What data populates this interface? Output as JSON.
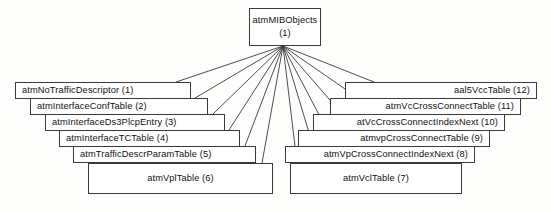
{
  "diagram": {
    "background_color": "#fdfdfc",
    "node_fill": "#ffffff",
    "node_border_color": "#3a3a3a",
    "edge_color": "#3a3a3a",
    "root": {
      "name": "atmMIBObjects",
      "index": "(1)",
      "x": 249,
      "y": 8,
      "width": 72,
      "height": 38
    },
    "fan_origin": {
      "x": 283,
      "y": 46
    },
    "children": [
      {
        "label": "atmNoTrafficDescriptor (1)",
        "name": "atmNoTrafficDescriptor",
        "index": "(1)",
        "align": "left",
        "x": 15,
        "y": 82,
        "width": 176,
        "height": 17,
        "anchor_x": 176,
        "anchor_y": 82
      },
      {
        "label": "atmInterfaceConfTable (2)",
        "name": "atmInterfaceConfTable",
        "index": "(2)",
        "align": "left",
        "x": 30,
        "y": 98,
        "width": 178,
        "height": 17,
        "anchor_x": 195,
        "anchor_y": 98
      },
      {
        "label": "atmInterfaceDs3PlcpEntry (3)",
        "name": "atmInterfaceDs3PlcpEntry",
        "index": "(3)",
        "align": "left",
        "x": 45,
        "y": 114,
        "width": 180,
        "height": 17,
        "anchor_x": 213,
        "anchor_y": 114
      },
      {
        "label": "atmInterfaceTCTable (4)",
        "name": "atmInterfaceTCTable",
        "index": "(4)",
        "align": "left",
        "x": 59,
        "y": 130,
        "width": 181,
        "height": 17,
        "anchor_x": 229,
        "anchor_y": 130
      },
      {
        "label": "atmTrafficDescrParamTable (5)",
        "name": "atmTrafficDescrParamTable",
        "index": "(5)",
        "align": "left",
        "x": 73,
        "y": 146,
        "width": 183,
        "height": 17,
        "anchor_x": 245,
        "anchor_y": 146
      },
      {
        "label": "atmVplTable (6)",
        "name": "atmVplTable",
        "index": "(6)",
        "align": "center",
        "x": 88,
        "y": 163,
        "width": 185,
        "height": 31,
        "anchor_x": 262,
        "anchor_y": 163
      },
      {
        "label": "atmVclTable (7)",
        "name": "atmVclTable",
        "index": "(7)",
        "align": "center",
        "x": 290,
        "y": 163,
        "width": 172,
        "height": 31,
        "anchor_x": 297,
        "anchor_y": 163
      },
      {
        "label": "atmVpCrossConnectIndexNext (8)",
        "name": "atmVpCrossConnectIndexNext",
        "index": "(8)",
        "align": "right",
        "x": 285,
        "y": 146,
        "width": 190,
        "height": 17,
        "anchor_x": 313,
        "anchor_y": 146
      },
      {
        "label": "atmvpCrossConnectTable (9)",
        "name": "atmvpCrossConnectTable",
        "index": "(9)",
        "align": "right",
        "x": 298,
        "y": 130,
        "width": 192,
        "height": 17,
        "anchor_x": 327,
        "anchor_y": 130
      },
      {
        "label": "atVcCrossConnectIndexNext (10)",
        "name": "atVcCrossConnectIndexNext",
        "index": "(10)",
        "align": "right",
        "x": 313,
        "y": 114,
        "width": 192,
        "height": 17,
        "anchor_x": 342,
        "anchor_y": 114
      },
      {
        "label": "atmVcCrossConnectTable (11)",
        "name": "atmVcCrossConnectTable",
        "index": "(11)",
        "align": "right",
        "x": 330,
        "y": 98,
        "width": 191,
        "height": 17,
        "anchor_x": 358,
        "anchor_y": 98
      },
      {
        "label": "aal5VccTable (12)",
        "name": "aal5VccTable",
        "index": "(12)",
        "align": "right",
        "x": 345,
        "y": 82,
        "width": 192,
        "height": 17,
        "anchor_x": 374,
        "anchor_y": 82
      }
    ]
  }
}
